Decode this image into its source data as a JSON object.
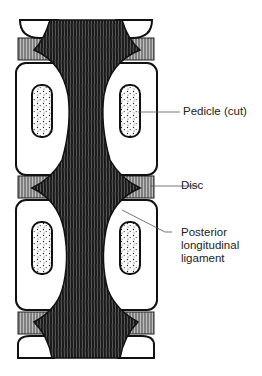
{
  "figure": {
    "labels": [
      {
        "id": "pedicle",
        "text": "Pedicle (cut)"
      },
      {
        "id": "disc",
        "text": "Disc"
      },
      {
        "id": "pll",
        "lines": [
          "Posterior",
          "longitudinal",
          "ligament"
        ]
      }
    ]
  }
}
